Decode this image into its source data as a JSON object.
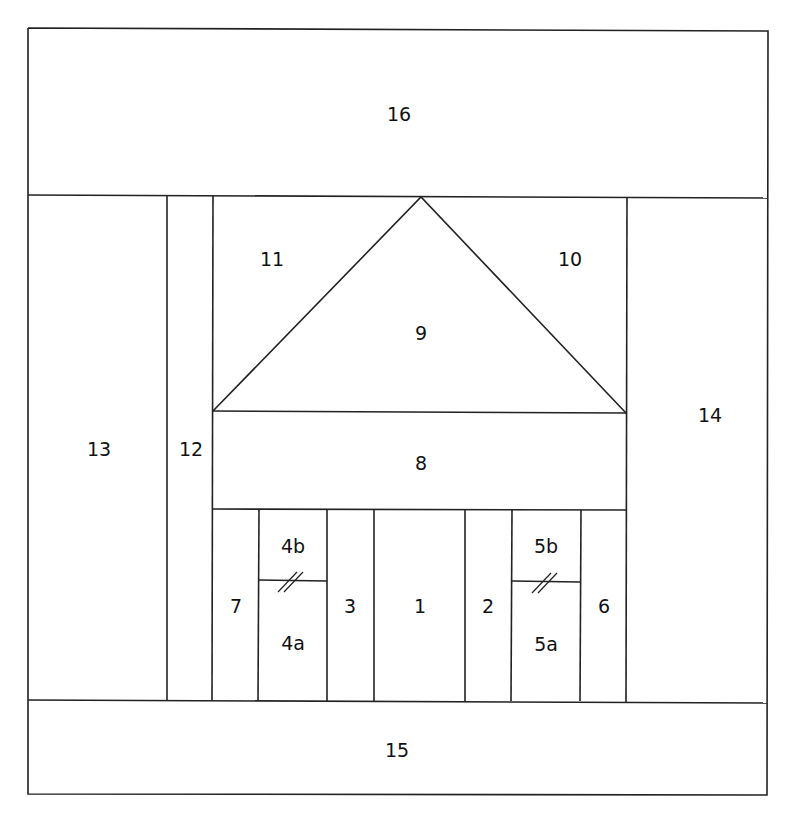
{
  "diagram": {
    "line_color": "#222222",
    "background": "#ffffff",
    "pieces": [
      {
        "id": "16",
        "label": "16",
        "x": 399,
        "y": 114
      },
      {
        "id": "11",
        "label": "11",
        "x": 272,
        "y": 259
      },
      {
        "id": "10",
        "label": "10",
        "x": 570,
        "y": 259
      },
      {
        "id": "9",
        "label": "9",
        "x": 421,
        "y": 333
      },
      {
        "id": "13",
        "label": "13",
        "x": 99,
        "y": 449
      },
      {
        "id": "12",
        "label": "12",
        "x": 191,
        "y": 449
      },
      {
        "id": "14",
        "label": "14",
        "x": 710,
        "y": 415
      },
      {
        "id": "8",
        "label": "8",
        "x": 421,
        "y": 463
      },
      {
        "id": "4b",
        "label": "4b",
        "x": 293,
        "y": 546
      },
      {
        "id": "5b",
        "label": "5b",
        "x": 546,
        "y": 546
      },
      {
        "id": "7",
        "label": "7",
        "x": 236,
        "y": 606
      },
      {
        "id": "3",
        "label": "3",
        "x": 350,
        "y": 606
      },
      {
        "id": "1",
        "label": "1",
        "x": 420,
        "y": 606
      },
      {
        "id": "2",
        "label": "2",
        "x": 488,
        "y": 606
      },
      {
        "id": "6",
        "label": "6",
        "x": 604,
        "y": 606
      },
      {
        "id": "4a",
        "label": "4a",
        "x": 293,
        "y": 643
      },
      {
        "id": "5a",
        "label": "5a",
        "x": 546,
        "y": 644
      },
      {
        "id": "15",
        "label": "15",
        "x": 397,
        "y": 750
      }
    ]
  }
}
